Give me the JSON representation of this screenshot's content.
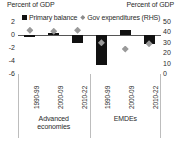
{
  "titles": {
    "left": "Percent of GDP",
    "right": "Percent of GDP"
  },
  "legend": {
    "items": [
      {
        "label": "Primary balance",
        "marker": "square-marker",
        "color": "#111111"
      },
      {
        "label": "Gov expenditures (RHS)",
        "marker": "diamond-marker",
        "color": "#9a9a9a"
      }
    ]
  },
  "axes": {
    "left_ticks": [
      "2",
      "0",
      "-2",
      "-4",
      "-6"
    ],
    "right_ticks": [
      "50",
      "40",
      "30",
      "20",
      "10",
      "0"
    ]
  },
  "groups": [
    {
      "label_line1": "Advanced",
      "label_line2": "economies"
    },
    {
      "label_line1": "EMDEs",
      "label_line2": ""
    }
  ],
  "chart_data": {
    "type": "bar",
    "title": "",
    "xlabel": "",
    "ylabel": "Percent of GDP",
    "ylabel_right": "Percent of GDP",
    "ylim": [
      -6,
      2
    ],
    "ylim_right": [
      0,
      50
    ],
    "grid": false,
    "legend_position": "top",
    "categories": [
      "1990-99",
      "2000-09",
      "2010-22",
      "1990-99",
      "2000-09",
      "2010-22"
    ],
    "group_labels": [
      "Advanced economies",
      "Advanced economies",
      "Advanced economies",
      "EMDEs",
      "EMDEs",
      "EMDEs"
    ],
    "series": [
      {
        "name": "Primary balance",
        "axis": "left",
        "type": "bar",
        "color": "#111111",
        "values": [
          -0.2,
          0.35,
          -1.2,
          -4.6,
          0.8,
          -1.4
        ]
      },
      {
        "name": "Gov expenditures (RHS)",
        "axis": "right",
        "type": "scatter",
        "color": "#9a9a9a",
        "values": [
          42,
          41,
          42,
          30,
          24,
          29
        ]
      }
    ]
  }
}
